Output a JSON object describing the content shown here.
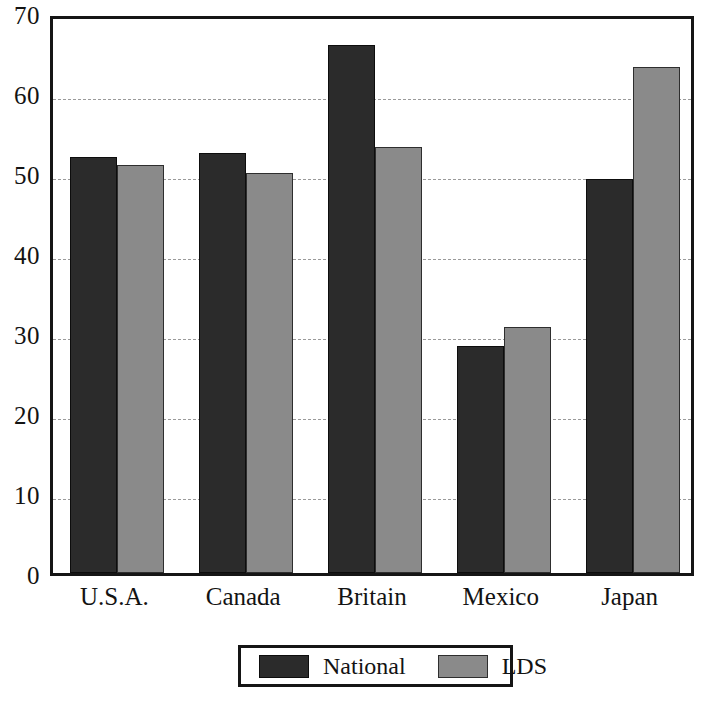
{
  "chart_data": {
    "type": "bar",
    "title": "",
    "subtitle": "",
    "xlabel": "",
    "ylabel": "",
    "categories": [
      "U.S.A.",
      "Canada",
      "Britain",
      "Mexico",
      "Japan"
    ],
    "series": [
      {
        "name": "National",
        "color": "#2b2b2b",
        "values": [
          52.0,
          52.5,
          66.0,
          28.4,
          49.2
        ]
      },
      {
        "name": "LDS",
        "color": "#8a8a8a",
        "values": [
          51.0,
          50.0,
          53.2,
          30.8,
          63.2
        ]
      }
    ],
    "ylim": [
      0,
      70
    ],
    "yticks": [
      0,
      10,
      20,
      30,
      40,
      50,
      60,
      70
    ],
    "ytick_labels": [
      "0",
      "10",
      "20",
      "30",
      "40",
      "50",
      "60",
      "70"
    ],
    "grid": true,
    "grid_axis": "y",
    "grid_style": "dashed",
    "legend_position": "bottom-center",
    "legend_entries": [
      "National",
      "LDS"
    ],
    "annotations": [],
    "frame": true,
    "background_color": "#ffffff"
  }
}
